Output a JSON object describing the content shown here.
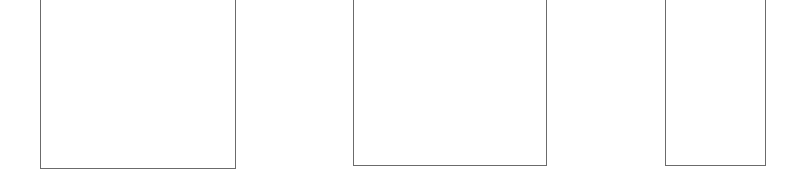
{
  "diagram": {
    "stroke_color": "#6b6b6b",
    "background": "#ffffff",
    "shapes": [
      {
        "id": "container-1",
        "type": "open-top-box",
        "left": 40,
        "right": 235,
        "bottom": 168
      },
      {
        "id": "container-2",
        "type": "open-top-box",
        "left": 353,
        "right": 546,
        "bottom": 165
      },
      {
        "id": "container-3",
        "type": "open-top-box",
        "left": 665,
        "right": 765,
        "bottom": 165
      }
    ]
  }
}
